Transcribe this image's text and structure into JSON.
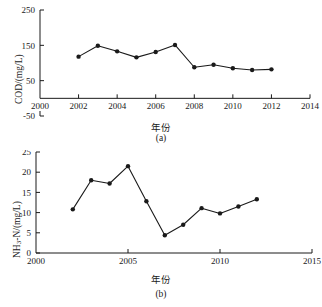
{
  "figure": {
    "panels": [
      {
        "id": "a",
        "subcaption": "(a)",
        "xlabel": "年份",
        "ylabel_html": "COD/(mg/L)",
        "ylabel_text": "COD/(mg/L)"
      },
      {
        "id": "b",
        "subcaption": "(b)",
        "xlabel": "年份",
        "ylabel_html": "NH<sub>3</sub>-N/(mg/L)",
        "ylabel_text": "NH3-N/(mg/L)"
      }
    ]
  },
  "chart_data": [
    {
      "type": "line",
      "panel": "a",
      "title": "",
      "subtitle": "(a)",
      "xlabel": "年份",
      "ylabel": "COD/(mg/L)",
      "x": [
        2002,
        2003,
        2004,
        2005,
        2006,
        2007,
        2008,
        2009,
        2010,
        2011,
        2012
      ],
      "values": [
        118,
        149,
        133,
        116,
        131,
        151,
        88,
        95,
        85,
        80,
        82
      ],
      "xlim": [
        2000,
        2014
      ],
      "ylim": [
        -50,
        250
      ],
      "xticks": [
        2000,
        2002,
        2004,
        2006,
        2008,
        2010,
        2012,
        2014
      ],
      "yticks": [
        -50,
        50,
        150,
        250
      ],
      "xtick_labels": [
        "2000",
        "2002",
        "2004",
        "2006",
        "2008",
        "2010",
        "2012",
        "2014"
      ],
      "ytick_labels": [
        "-50",
        "50",
        "150",
        "250"
      ],
      "grid": false,
      "legend": null,
      "marker": "filled-circle",
      "line_color": "#1a1a1a",
      "marker_color": "#1a1a1a",
      "axis_baseline_value": 0
    },
    {
      "type": "line",
      "panel": "b",
      "title": "",
      "subtitle": "(b)",
      "xlabel": "年份",
      "ylabel": "NH3-N/(mg/L)",
      "x": [
        2002,
        2003,
        2004,
        2005,
        2006,
        2007,
        2008,
        2009,
        2010,
        2011,
        2012
      ],
      "values": [
        10.8,
        18.0,
        17.2,
        21.5,
        12.8,
        4.4,
        7.0,
        11.1,
        9.8,
        11.5,
        13.3
      ],
      "xlim": [
        2000,
        2015
      ],
      "ylim": [
        0,
        25
      ],
      "xticks": [
        2000,
        2005,
        2010,
        2015
      ],
      "yticks": [
        0,
        5,
        10,
        15,
        20,
        25
      ],
      "xtick_labels": [
        "2000",
        "2005",
        "2010",
        "2015"
      ],
      "ytick_labels": [
        "0",
        "5",
        "10",
        "15",
        "20",
        "25"
      ],
      "grid": false,
      "legend": null,
      "marker": "filled-circle",
      "line_color": "#1a1a1a",
      "marker_color": "#1a1a1a",
      "axis_baseline_value": 0
    }
  ]
}
